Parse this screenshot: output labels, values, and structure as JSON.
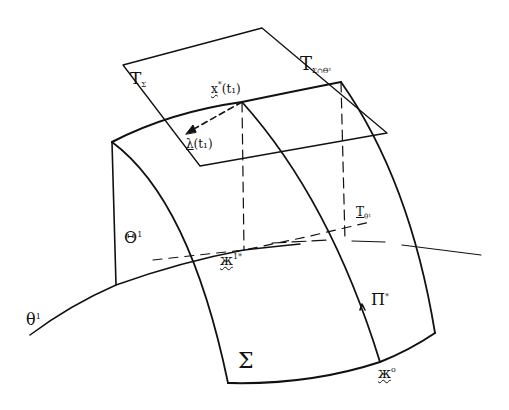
{
  "diagram": {
    "stroke_color": "#111111",
    "background": "#ffffff",
    "labels": {
      "tangent_plane_sigma": {
        "base": "T",
        "sub": "Σ"
      },
      "tangent_plane_intersection": {
        "base": "T",
        "sub": "Σ∩Θ¹"
      },
      "tangent_plane_theta": {
        "base": "T",
        "sub": "θ¹"
      },
      "point_x_star_t1": {
        "base": "x",
        "sup": "*",
        "args": "(t₁)"
      },
      "vector_lambda_t1": {
        "base": "λ",
        "args": "(t₁)"
      },
      "surface_theta_capital": {
        "base": "Θ",
        "sup": "1"
      },
      "curve_theta_lower": {
        "base": "θ",
        "sup": "1"
      },
      "point_x_1_star": {
        "base": "ж",
        "sup": "1*"
      },
      "curve_pi_star": {
        "base": "Π",
        "sup": "*"
      },
      "surface_sigma": {
        "base": "Σ"
      },
      "point_x_zero": {
        "base": "ж",
        "sup": "o"
      }
    }
  }
}
